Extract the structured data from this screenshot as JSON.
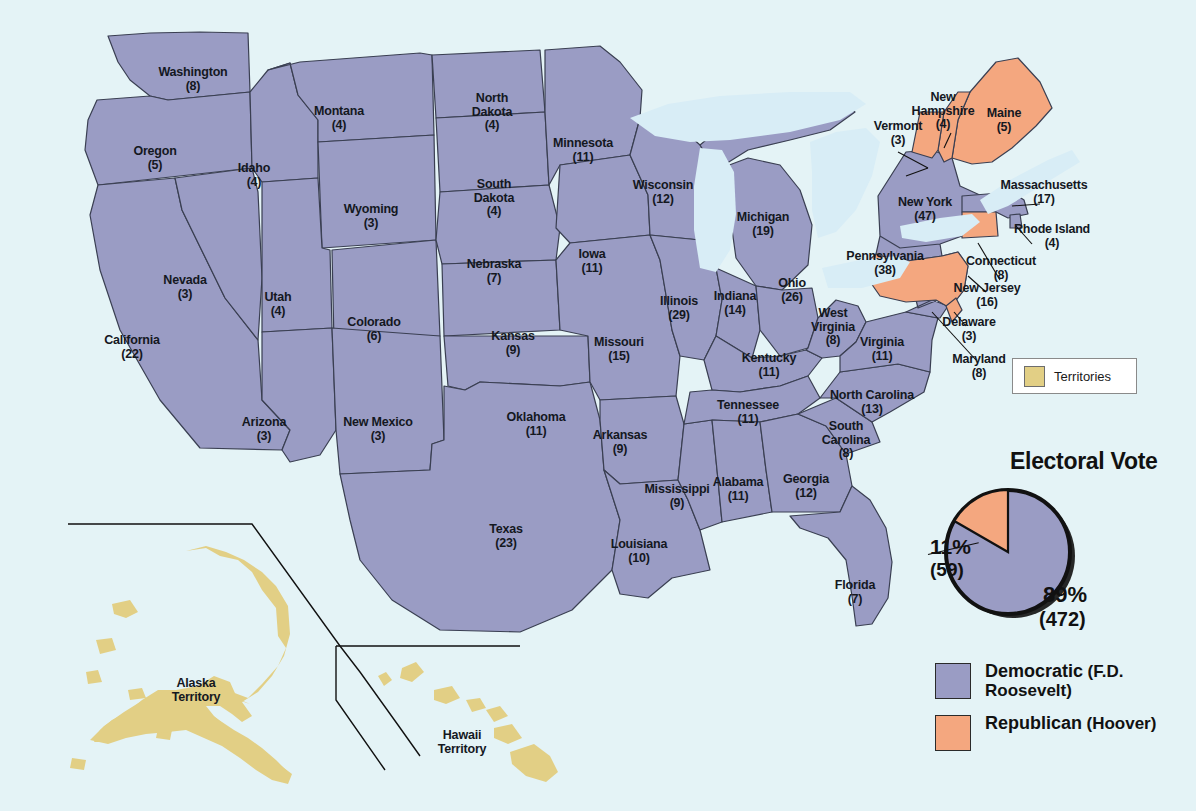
{
  "map": {
    "title": "1932 United States Presidential Election Electoral Map",
    "colors": {
      "democratic": "#9a9cc4",
      "republican": "#f4a77f",
      "territory": "#e2cf85",
      "water": "#e4f3f6",
      "lakes": "#d6ecf5",
      "border": "#3a3f52",
      "text": "#14181f"
    }
  },
  "territories_legend": {
    "label": "Territories",
    "swatch_color": "#e2cf85"
  },
  "electoral_vote": {
    "title": "Electoral Vote",
    "republican_pct": "11%",
    "republican_count": "(59)",
    "democratic_pct": "89%",
    "democratic_count": "(472)"
  },
  "party_legend": [
    {
      "party": "Democratic",
      "candidate": "(F.D. Roosevelt)",
      "color": "#9a9cc4"
    },
    {
      "party": "Republican",
      "candidate": "(Hoover)",
      "color": "#f4a77f"
    }
  ],
  "territories": [
    {
      "name": "Alaska",
      "sub": "Territory",
      "x": 196,
      "y": 690
    },
    {
      "name": "Hawaii",
      "sub": "Territory",
      "x": 462,
      "y": 742
    }
  ],
  "chart_data": {
    "type": "pie",
    "title": "Electoral Vote",
    "categories": [
      "Democratic (F.D. Roosevelt)",
      "Republican (Hoover)"
    ],
    "values": [
      472,
      59
    ],
    "percentages": [
      89,
      11
    ],
    "colors": [
      "#9a9cc4",
      "#f4a77f"
    ],
    "legend": "right"
  },
  "states": [
    {
      "name": "Washington",
      "ev": "(8)",
      "party": "democratic",
      "x": 193,
      "y": 79
    },
    {
      "name": "Oregon",
      "ev": "(5)",
      "party": "democratic",
      "x": 155,
      "y": 158
    },
    {
      "name": "Idaho",
      "ev": "(4)",
      "party": "democratic",
      "x": 254,
      "y": 175
    },
    {
      "name": "Montana",
      "ev": "(4)",
      "party": "democratic",
      "x": 339,
      "y": 118
    },
    {
      "name": "Wyoming",
      "ev": "(3)",
      "party": "democratic",
      "x": 371,
      "y": 216
    },
    {
      "name": "Nevada",
      "ev": "(3)",
      "party": "democratic",
      "x": 185,
      "y": 287
    },
    {
      "name": "Utah",
      "ev": "(4)",
      "party": "democratic",
      "x": 278,
      "y": 304
    },
    {
      "name": "California",
      "ev": "(22)",
      "party": "democratic",
      "x": 132,
      "y": 347
    },
    {
      "name": "Arizona",
      "ev": "(3)",
      "party": "democratic",
      "x": 264,
      "y": 429
    },
    {
      "name": "New Mexico",
      "ev": "(3)",
      "party": "democratic",
      "x": 378,
      "y": 429
    },
    {
      "name": "Colorado",
      "ev": "(6)",
      "party": "democratic",
      "x": 374,
      "y": 329
    },
    {
      "name": "North\nDakota",
      "ev": "(4)",
      "party": "democratic",
      "x": 492,
      "y": 112
    },
    {
      "name": "South\nDakota",
      "ev": "(4)",
      "party": "democratic",
      "x": 494,
      "y": 198
    },
    {
      "name": "Nebraska",
      "ev": "(7)",
      "party": "democratic",
      "x": 494,
      "y": 271
    },
    {
      "name": "Kansas",
      "ev": "(9)",
      "party": "democratic",
      "x": 513,
      "y": 343
    },
    {
      "name": "Oklahoma",
      "ev": "(11)",
      "party": "democratic",
      "x": 536,
      "y": 424
    },
    {
      "name": "Texas",
      "ev": "(23)",
      "party": "democratic",
      "x": 506,
      "y": 536
    },
    {
      "name": "Minnesota",
      "ev": "(11)",
      "party": "democratic",
      "x": 583,
      "y": 150
    },
    {
      "name": "Iowa",
      "ev": "(11)",
      "party": "democratic",
      "x": 592,
      "y": 261
    },
    {
      "name": "Missouri",
      "ev": "(15)",
      "party": "democratic",
      "x": 619,
      "y": 349
    },
    {
      "name": "Arkansas",
      "ev": "(9)",
      "party": "democratic",
      "x": 620,
      "y": 442
    },
    {
      "name": "Louisiana",
      "ev": "(10)",
      "party": "democratic",
      "x": 639,
      "y": 551
    },
    {
      "name": "Wisconsin",
      "ev": "(12)",
      "party": "democratic",
      "x": 663,
      "y": 192
    },
    {
      "name": "Illinois",
      "ev": "(29)",
      "party": "democratic",
      "x": 679,
      "y": 308
    },
    {
      "name": "Mississippi",
      "ev": "(9)",
      "party": "democratic",
      "x": 677,
      "y": 496
    },
    {
      "name": "Michigan",
      "ev": "(19)",
      "party": "democratic",
      "x": 763,
      "y": 224
    },
    {
      "name": "Indiana",
      "ev": "(14)",
      "party": "democratic",
      "x": 735,
      "y": 303
    },
    {
      "name": "Ohio",
      "ev": "(26)",
      "party": "democratic",
      "x": 792,
      "y": 290
    },
    {
      "name": "Kentucky",
      "ev": "(11)",
      "party": "democratic",
      "x": 769,
      "y": 365
    },
    {
      "name": "Tennessee",
      "ev": "(11)",
      "party": "democratic",
      "x": 748,
      "y": 412
    },
    {
      "name": "Alabama",
      "ev": "(11)",
      "party": "democratic",
      "x": 738,
      "y": 489
    },
    {
      "name": "Georgia",
      "ev": "(12)",
      "party": "democratic",
      "x": 806,
      "y": 486
    },
    {
      "name": "Florida",
      "ev": "(7)",
      "party": "democratic",
      "x": 855,
      "y": 592
    },
    {
      "name": "South\nCarolina",
      "ev": "(8)",
      "party": "democratic",
      "x": 846,
      "y": 440
    },
    {
      "name": "North Carolina",
      "ev": "(13)",
      "party": "democratic",
      "x": 872,
      "y": 402
    },
    {
      "name": "West\nVirginia",
      "ev": "(8)",
      "party": "democratic",
      "x": 833,
      "y": 327
    },
    {
      "name": "Virginia",
      "ev": "(11)",
      "party": "democratic",
      "x": 882,
      "y": 349
    },
    {
      "name": "New York",
      "ev": "(47)",
      "party": "democratic",
      "x": 925,
      "y": 209
    },
    {
      "name": "Massachusetts",
      "ev": "(17)",
      "party": "democratic",
      "x": 1044,
      "y": 192
    },
    {
      "name": "Rhode Island",
      "ev": "(4)",
      "party": "democratic",
      "x": 1052,
      "y": 236
    },
    {
      "name": "New Jersey",
      "ev": "(16)",
      "party": "democratic",
      "x": 987,
      "y": 295
    },
    {
      "name": "Maryland",
      "ev": "(8)",
      "party": "democratic",
      "x": 979,
      "y": 366
    },
    {
      "name": "Maine",
      "ev": "(5)",
      "party": "republican",
      "x": 1004,
      "y": 120
    },
    {
      "name": "New\nHampshire",
      "ev": "(4)",
      "party": "republican",
      "x": 943,
      "y": 111
    },
    {
      "name": "Vermont",
      "ev": "(3)",
      "party": "republican",
      "x": 898,
      "y": 133
    },
    {
      "name": "Connecticut",
      "ev": "(8)",
      "party": "republican",
      "x": 1001,
      "y": 268
    },
    {
      "name": "Pennsylvania",
      "ev": "(38)",
      "party": "republican",
      "x": 885,
      "y": 263
    },
    {
      "name": "Delaware",
      "ev": "(3)",
      "party": "republican",
      "x": 969,
      "y": 329
    }
  ]
}
